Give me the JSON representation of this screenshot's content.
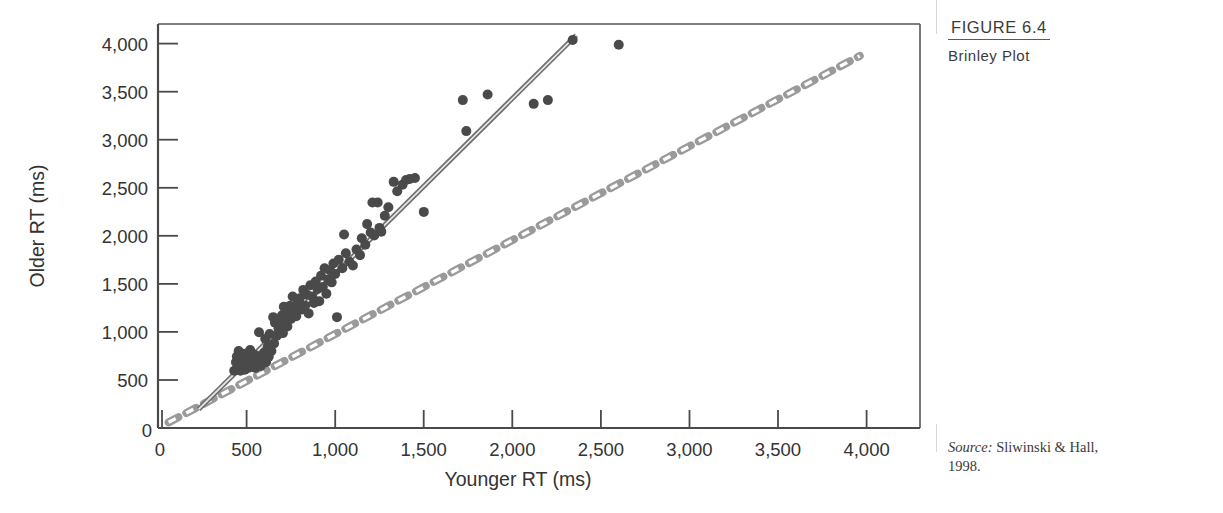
{
  "figure": {
    "number": "FIGURE 6.4",
    "title": "Brinley Plot"
  },
  "source": {
    "label": "Source:",
    "text": " Sliwinski & Hall,",
    "line2": "1998."
  },
  "chart_data": {
    "type": "scatter",
    "title": "Brinley Plot",
    "xlabel": "Younger RT (ms)",
    "ylabel": "Older RT (ms)",
    "xlim": [
      0,
      4300
    ],
    "ylim": [
      0,
      4300
    ],
    "xticks": [
      0,
      500,
      1000,
      1500,
      2000,
      2500,
      3000,
      3500,
      4000
    ],
    "xticklabels": [
      "0",
      "500",
      "1,000",
      "1,500",
      "2,000",
      "2,500",
      "3,000",
      "3,500",
      "4,000"
    ],
    "yticks": [
      0,
      500,
      1000,
      1500,
      2000,
      2500,
      3000,
      3500,
      4000
    ],
    "yticklabels": [
      "0",
      "500",
      "1,000",
      "1,500",
      "2,000",
      "2,500",
      "3,000",
      "3,500",
      "4,000"
    ],
    "grid": false,
    "legend": null,
    "marker_color": "#4a4a4a",
    "marker_size": 10,
    "series": [
      {
        "name": "Younger vs Older RT",
        "points": [
          [
            430,
            610
          ],
          [
            440,
            700
          ],
          [
            445,
            760
          ],
          [
            450,
            640
          ],
          [
            455,
            820
          ],
          [
            460,
            700
          ],
          [
            465,
            610
          ],
          [
            470,
            750
          ],
          [
            475,
            660
          ],
          [
            480,
            700
          ],
          [
            485,
            790
          ],
          [
            490,
            620
          ],
          [
            495,
            710
          ],
          [
            500,
            680
          ],
          [
            505,
            760
          ],
          [
            510,
            640
          ],
          [
            515,
            700
          ],
          [
            520,
            830
          ],
          [
            525,
            720
          ],
          [
            530,
            660
          ],
          [
            540,
            700
          ],
          [
            545,
            780
          ],
          [
            550,
            640
          ],
          [
            555,
            720
          ],
          [
            560,
            690
          ],
          [
            565,
            760
          ],
          [
            570,
            1020
          ],
          [
            575,
            700
          ],
          [
            580,
            660
          ],
          [
            590,
            740
          ],
          [
            600,
            800
          ],
          [
            605,
            950
          ],
          [
            610,
            700
          ],
          [
            620,
            870
          ],
          [
            625,
            760
          ],
          [
            630,
            1000
          ],
          [
            640,
            820
          ],
          [
            650,
            1180
          ],
          [
            655,
            900
          ],
          [
            660,
            1120
          ],
          [
            670,
            980
          ],
          [
            680,
            1060
          ],
          [
            690,
            1130
          ],
          [
            700,
            1200
          ],
          [
            705,
            1010
          ],
          [
            710,
            1290
          ],
          [
            720,
            1150
          ],
          [
            730,
            1080
          ],
          [
            740,
            1230
          ],
          [
            745,
            1300
          ],
          [
            750,
            1160
          ],
          [
            760,
            1400
          ],
          [
            770,
            1250
          ],
          [
            780,
            1190
          ],
          [
            790,
            1340
          ],
          [
            800,
            1380
          ],
          [
            810,
            1260
          ],
          [
            820,
            1470
          ],
          [
            830,
            1300
          ],
          [
            840,
            1420
          ],
          [
            850,
            1220
          ],
          [
            860,
            1520
          ],
          [
            870,
            1400
          ],
          [
            880,
            1330
          ],
          [
            890,
            1560
          ],
          [
            900,
            1480
          ],
          [
            910,
            1350
          ],
          [
            920,
            1620
          ],
          [
            930,
            1500
          ],
          [
            940,
            1700
          ],
          [
            950,
            1430
          ],
          [
            960,
            1580
          ],
          [
            970,
            1680
          ],
          [
            980,
            1550
          ],
          [
            990,
            1750
          ],
          [
            1000,
            1640
          ],
          [
            1010,
            1180
          ],
          [
            1020,
            1790
          ],
          [
            1040,
            1700
          ],
          [
            1050,
            2060
          ],
          [
            1060,
            1860
          ],
          [
            1080,
            1770
          ],
          [
            1100,
            1730
          ],
          [
            1120,
            1900
          ],
          [
            1140,
            1840
          ],
          [
            1150,
            2020
          ],
          [
            1170,
            1950
          ],
          [
            1180,
            2170
          ],
          [
            1200,
            2080
          ],
          [
            1210,
            2400
          ],
          [
            1220,
            2050
          ],
          [
            1240,
            2400
          ],
          [
            1250,
            2130
          ],
          [
            1260,
            2090
          ],
          [
            1280,
            2260
          ],
          [
            1300,
            2350
          ],
          [
            1330,
            2620
          ],
          [
            1350,
            2520
          ],
          [
            1380,
            2590
          ],
          [
            1400,
            2640
          ],
          [
            1420,
            2650
          ],
          [
            1450,
            2660
          ],
          [
            1500,
            2300
          ],
          [
            1720,
            3490
          ],
          [
            1740,
            3160
          ],
          [
            1860,
            3550
          ],
          [
            2120,
            3450
          ],
          [
            2200,
            3490
          ],
          [
            2340,
            4130
          ],
          [
            2600,
            4080
          ]
        ]
      }
    ],
    "reference_lines": [
      {
        "name": "unity-line",
        "style": "dashed",
        "color": "#8a8a8a",
        "from": [
          60,
          60
        ],
        "to": [
          3960,
          3960
        ],
        "description": "1:1 diagonal reference line"
      },
      {
        "name": "regression-line",
        "style": "solid-double",
        "color": "#7d7d7d",
        "from": [
          230,
          200
        ],
        "to": [
          2360,
          4180
        ],
        "description": "fitted Brinley regression line"
      }
    ]
  }
}
